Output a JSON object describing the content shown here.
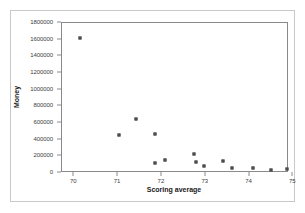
{
  "chart_data": {
    "type": "scatter",
    "title": "",
    "xlabel": "Scoring average",
    "ylabel": "Money",
    "xlim": [
      69.72,
      74.9
    ],
    "ylim": [
      0,
      1800000
    ],
    "grid": false,
    "legend": null,
    "xticks": [
      70,
      71,
      72,
      73,
      74,
      75
    ],
    "xtick_labels": [
      "70",
      "71",
      "72",
      "73",
      "74",
      "75"
    ],
    "yticks": [
      0,
      200000,
      400000,
      600000,
      800000,
      1000000,
      1200000,
      1400000,
      1600000,
      1800000
    ],
    "ytick_labels": [
      "0",
      "200000",
      "400000",
      "600000",
      "800000",
      "1000000",
      "1200000",
      "1400000",
      "1600000",
      "1800000"
    ],
    "marker": "filled-square",
    "marker_color": "#595959",
    "points": [
      {
        "x": 70.12,
        "y": 1625000
      },
      {
        "x": 71.02,
        "y": 455000
      },
      {
        "x": 71.4,
        "y": 645000
      },
      {
        "x": 71.85,
        "y": 470000
      },
      {
        "x": 71.85,
        "y": 115000
      },
      {
        "x": 72.06,
        "y": 160000
      },
      {
        "x": 72.74,
        "y": 225000
      },
      {
        "x": 72.77,
        "y": 135000
      },
      {
        "x": 72.96,
        "y": 90000
      },
      {
        "x": 73.4,
        "y": 140000
      },
      {
        "x": 73.6,
        "y": 65000
      },
      {
        "x": 74.08,
        "y": 60000
      },
      {
        "x": 74.5,
        "y": 40000
      },
      {
        "x": 74.85,
        "y": 50000
      }
    ]
  },
  "axes": {
    "x_title": "Scoring average",
    "y_title": "Money"
  },
  "colors": {
    "marker": "#595959",
    "panel_border": "#8a8a8a",
    "outer_border": "#c9c9c9",
    "background": "#ffffff",
    "tick_text": "#3d3d3d",
    "title_text": "#1a1a1a"
  }
}
